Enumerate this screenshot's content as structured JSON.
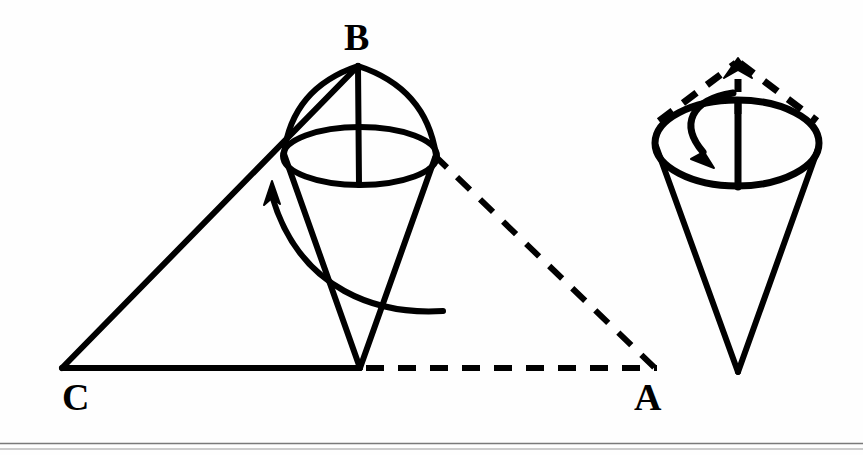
{
  "figure": {
    "background_color": "#fefefe",
    "stroke_color": "#000000",
    "labels": {
      "apex_top": "B",
      "base_left": "C",
      "base_right": "A"
    },
    "left_diagram": {
      "name": "triangle-with-inscribed-cone",
      "triangle": {
        "vertex_B": [
          358,
          66
        ],
        "vertex_C": [
          62,
          368
        ],
        "vertex_A": [
          655,
          368
        ],
        "solid_edges": [
          "C-B",
          "C-A-partial"
        ],
        "dashed_edges": [
          "B-A",
          "base-right-segment"
        ]
      },
      "cone": {
        "apex": [
          360,
          368
        ],
        "ellipse_center": [
          360,
          156
        ],
        "ellipse_rx": 77,
        "ellipse_ry": 29,
        "axis_line": "B-to-ellipse-bottom"
      },
      "rotation_arrow": {
        "direction": "counterclockwise-upward",
        "arrowhead_at": [
          272,
          183
        ]
      }
    },
    "right_diagram": {
      "name": "standalone-cone-with-rotation",
      "cone": {
        "apex": [
          738,
          372
        ],
        "ellipse_center": [
          737,
          143
        ],
        "ellipse_rx": 82,
        "ellipse_ry": 43,
        "axis_line": "top-to-ellipse-bottom"
      },
      "dashed_tent": {
        "apex": [
          738,
          62
        ],
        "left_foot": [
          659,
          119
        ],
        "right_foot": [
          816,
          119
        ]
      },
      "up_arrow": {
        "from": [
          738,
          112
        ],
        "to": [
          738,
          66
        ],
        "style": "dashed"
      },
      "rotation_arrow": {
        "direction": "clockwise-downward",
        "arrowhead_at": [
          700,
          160
        ]
      }
    },
    "footer_rules": {
      "count": 2,
      "y_positions": [
        443,
        449
      ]
    }
  }
}
